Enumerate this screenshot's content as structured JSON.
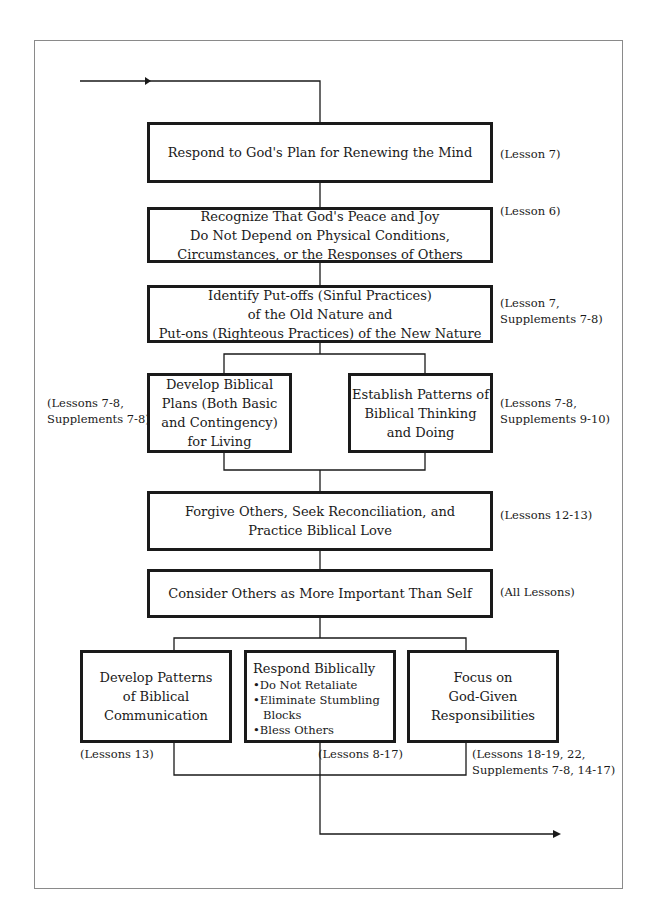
{
  "flowchart": {
    "nodes": [
      {
        "id": "renew",
        "lines": [
          "Respond to God's Plan for Renewing the Mind"
        ],
        "ref": [
          "(Lesson 7)"
        ]
      },
      {
        "id": "peace",
        "lines": [
          "Recognize That God's Peace and Joy",
          "Do Not Depend on Physical Conditions,",
          "Circumstances, or the Responses of Others"
        ],
        "ref": [
          "(Lesson 6)"
        ]
      },
      {
        "id": "putoffs",
        "lines": [
          "Identify Put-offs (Sinful Practices)",
          "of the Old Nature and",
          "Put-ons (Righteous Practices) of the New Nature"
        ],
        "ref": [
          "(Lesson 7,",
          "Supplements 7-8)"
        ]
      },
      {
        "id": "plans",
        "lines": [
          "Develop Biblical",
          "Plans (Both Basic",
          "and Contingency)",
          "for Living"
        ],
        "ref": [
          "(Lessons 7-8,",
          "Supplements 7-8)"
        ]
      },
      {
        "id": "patterns",
        "lines": [
          "Establish Patterns of",
          "Biblical Thinking",
          "and Doing"
        ],
        "ref": [
          "(Lessons 7-8,",
          "Supplements 9-10)"
        ]
      },
      {
        "id": "forgive",
        "lines": [
          "Forgive Others, Seek Reconciliation, and",
          "Practice Biblical Love"
        ],
        "ref": [
          "(Lessons 12-13)"
        ]
      },
      {
        "id": "consider",
        "lines": [
          "Consider Others as More Important Than Self"
        ],
        "ref": [
          "(All Lessons)"
        ]
      },
      {
        "id": "communication",
        "lines": [
          "Develop Patterns",
          "of Biblical",
          "Communication"
        ],
        "ref": [
          "(Lessons 13)"
        ]
      },
      {
        "id": "respond",
        "lines": [
          "Respond Biblically",
          "•Do Not Retaliate",
          "•Eliminate Stumbling",
          "Blocks",
          "•Bless Others"
        ],
        "ref": [
          "(Lessons 8-17)"
        ]
      },
      {
        "id": "focus",
        "lines": [
          "Focus on",
          "God-Given",
          "Responsibilities"
        ],
        "ref": [
          "(Lessons 18-19, 22,",
          "Supplements 7-8, 14-17)"
        ]
      }
    ],
    "edges": [
      [
        "start",
        "renew"
      ],
      [
        "renew",
        "peace"
      ],
      [
        "peace",
        "putoffs"
      ],
      [
        "putoffs",
        "plans"
      ],
      [
        "putoffs",
        "patterns"
      ],
      [
        "plans",
        "forgive"
      ],
      [
        "patterns",
        "forgive"
      ],
      [
        "forgive",
        "consider"
      ],
      [
        "consider",
        "communication"
      ],
      [
        "consider",
        "respond"
      ],
      [
        "consider",
        "focus"
      ],
      [
        "communication",
        "end"
      ],
      [
        "respond",
        "end"
      ],
      [
        "focus",
        "end"
      ]
    ]
  }
}
